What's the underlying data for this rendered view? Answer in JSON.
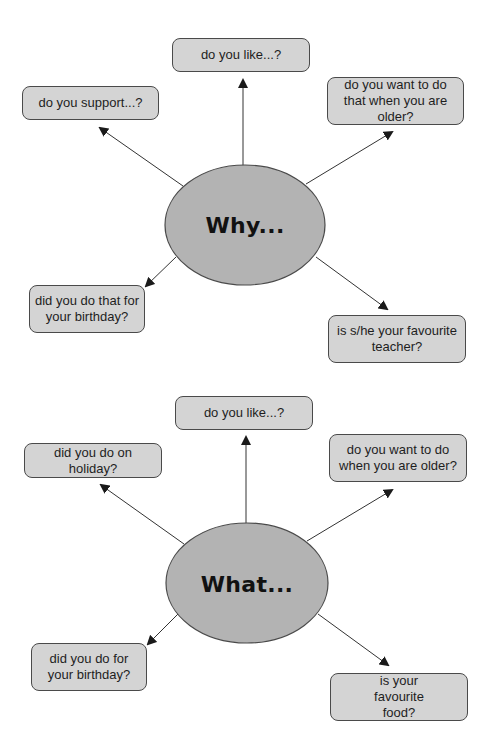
{
  "colors": {
    "box_fill": "#d4d4d4",
    "box_border": "#4a4a4a",
    "hub_fill": "#b3b3b3",
    "hub_border": "#4a4a4a",
    "arrow": "#333333",
    "text": "#1e1e1e"
  },
  "diagrams": [
    {
      "hub": "Why...",
      "nodes": [
        {
          "id": "like",
          "text": "do you like...?"
        },
        {
          "id": "support",
          "text": "do you support...?"
        },
        {
          "id": "older",
          "text": "do you want to do that when you are older?"
        },
        {
          "id": "birthday",
          "text": "did you do that for your birthday?"
        },
        {
          "id": "teacher",
          "text": "is s/he your favourite teacher?"
        }
      ]
    },
    {
      "hub": "What...",
      "nodes": [
        {
          "id": "like",
          "text": "do you like...?"
        },
        {
          "id": "holiday",
          "text": "did you do on holiday?"
        },
        {
          "id": "older",
          "text": "do you want to do when you are older?"
        },
        {
          "id": "birthday",
          "text": "did you do for your birthday?"
        },
        {
          "id": "food",
          "text": "is your favourite food?"
        }
      ]
    }
  ]
}
